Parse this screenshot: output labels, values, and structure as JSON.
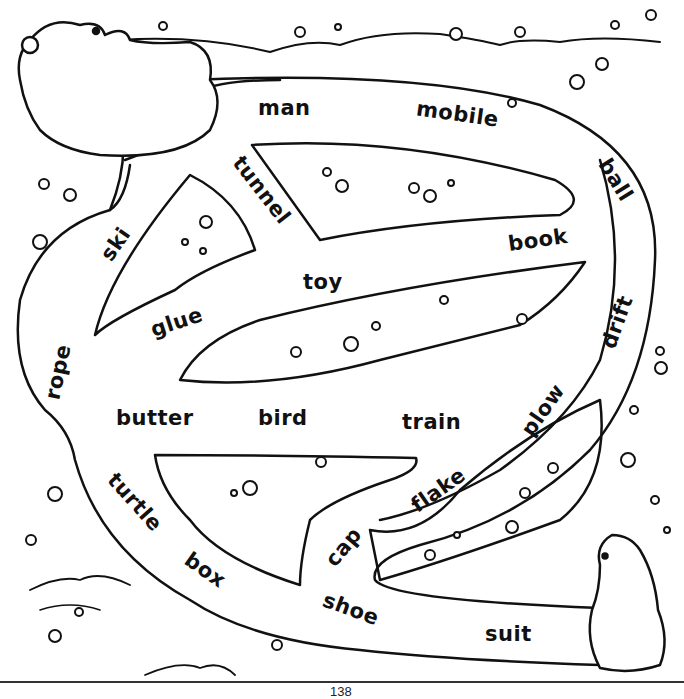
{
  "worksheet": {
    "type": "maze",
    "theme": "polar bears in snow",
    "words": [
      {
        "text": "man",
        "x": 258,
        "y": 96,
        "rot": 0
      },
      {
        "text": "mobile",
        "x": 416,
        "y": 102,
        "rot": 8
      },
      {
        "text": "ball",
        "x": 593,
        "y": 168,
        "rot": 58
      },
      {
        "text": "tunnel",
        "x": 222,
        "y": 178,
        "rot": 52
      },
      {
        "text": "ski",
        "x": 98,
        "y": 232,
        "rot": -55
      },
      {
        "text": "book",
        "x": 508,
        "y": 228,
        "rot": -8
      },
      {
        "text": "toy",
        "x": 303,
        "y": 270,
        "rot": 0
      },
      {
        "text": "glue",
        "x": 150,
        "y": 310,
        "rot": -18
      },
      {
        "text": "drift",
        "x": 590,
        "y": 310,
        "rot": -70
      },
      {
        "text": "rope",
        "x": 30,
        "y": 360,
        "rot": -78
      },
      {
        "text": "butter",
        "x": 116,
        "y": 406,
        "rot": 0
      },
      {
        "text": "bird",
        "x": 258,
        "y": 406,
        "rot": 0
      },
      {
        "text": "train",
        "x": 402,
        "y": 410,
        "rot": 0
      },
      {
        "text": "plow",
        "x": 514,
        "y": 398,
        "rot": -55
      },
      {
        "text": "turtle",
        "x": 100,
        "y": 490,
        "rot": 48
      },
      {
        "text": "flake",
        "x": 408,
        "y": 478,
        "rot": -35
      },
      {
        "text": "cap",
        "x": 322,
        "y": 535,
        "rot": -50
      },
      {
        "text": "box",
        "x": 183,
        "y": 558,
        "rot": 35
      },
      {
        "text": "shoe",
        "x": 322,
        "y": 597,
        "rot": 20
      },
      {
        "text": "suit",
        "x": 485,
        "y": 622,
        "rot": 0
      }
    ],
    "page_number": "138"
  }
}
